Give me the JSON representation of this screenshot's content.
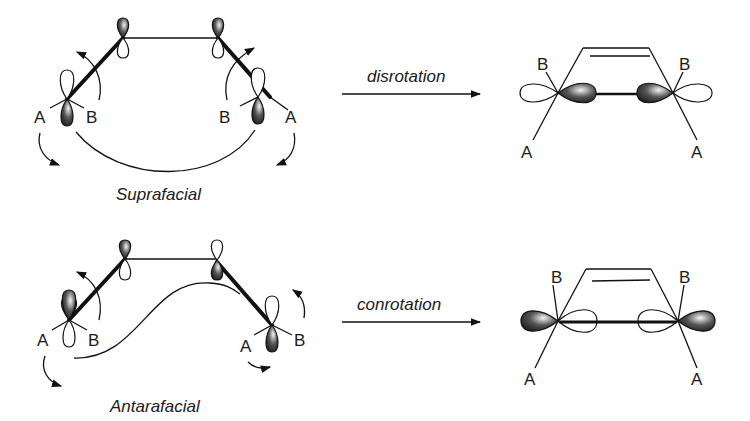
{
  "diagram": {
    "panels": [
      {
        "caption": "Suprafacial",
        "arrow_label": "disrotation",
        "reactant_labels": {
          "left_a": "A",
          "left_b": "B",
          "right_b": "B",
          "right_a": "A"
        },
        "product_labels": {
          "left_b": "B",
          "left_a": "A",
          "right_b": "B",
          "right_a": "A"
        }
      },
      {
        "caption": "Antarafacial",
        "arrow_label": "conrotation",
        "reactant_labels": {
          "left_a": "A",
          "left_b": "B",
          "right_a": "A",
          "right_b": "B"
        },
        "product_labels": {
          "left_b": "B",
          "left_a": "A",
          "right_b": "B",
          "right_a": "A"
        }
      }
    ]
  }
}
